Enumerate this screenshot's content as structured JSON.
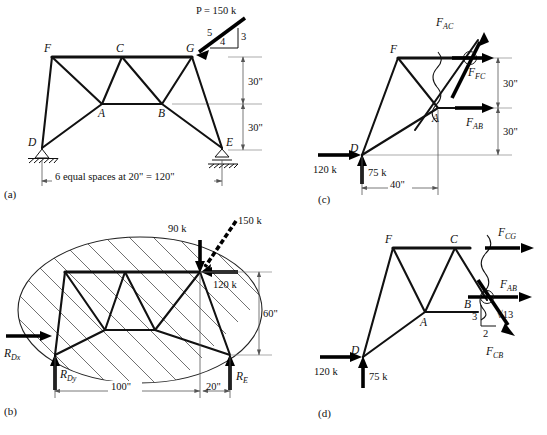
{
  "figure": {
    "panels": [
      {
        "id": "a",
        "label": "(a)"
      },
      {
        "id": "b",
        "label": "(b)"
      },
      {
        "id": "c",
        "label": "(c)"
      },
      {
        "id": "d",
        "label": "(d)"
      }
    ]
  },
  "panel_a": {
    "label": "(a)",
    "joints": [
      "F",
      "C",
      "G",
      "A",
      "B",
      "D",
      "E"
    ],
    "joint_F": "F",
    "joint_C": "C",
    "joint_G": "G",
    "joint_A": "A",
    "joint_B": "B",
    "joint_D": "D",
    "joint_E": "E",
    "applied_load": "P = 150 k",
    "slope_hyp": "5",
    "slope_vert": "3",
    "slope_horiz": "4",
    "dim_upper": "30\"",
    "dim_lower": "30\"",
    "span_note": "6 equal spaces at 20\" = 120\""
  },
  "panel_b": {
    "label": "(b)",
    "load_vertical": "90 k",
    "load_diagonal": "150 k",
    "load_horizontal": "120 k",
    "reaction_dx": "R",
    "reaction_dx_sub": "Dx",
    "reaction_dy": "R",
    "reaction_dy_sub": "Dy",
    "reaction_e": "R",
    "reaction_e_sub": "E",
    "dim_height": "60\"",
    "dim_main": "100\"",
    "dim_overhang": "20\""
  },
  "panel_c": {
    "label": "(c)",
    "joint_F": "F",
    "joint_A": "A",
    "joint_D": "D",
    "force_ac": "F",
    "force_ac_sub": "AC",
    "force_fc": "F",
    "force_fc_sub": "FC",
    "force_ab": "F",
    "force_ab_sub": "AB",
    "reaction_h": "120 k",
    "reaction_v": "75 k",
    "dim_upper": "30\"",
    "dim_lower": "30\"",
    "dim_horiz": "40\""
  },
  "panel_d": {
    "label": "(d)",
    "joint_F": "F",
    "joint_C": "C",
    "joint_A": "A",
    "joint_B": "B",
    "joint_D": "D",
    "force_cg": "F",
    "force_cg_sub": "CG",
    "force_ab": "F",
    "force_ab_sub": "AB",
    "force_cb": "F",
    "force_cb_sub": "CB",
    "slope_vert": "3",
    "slope_horiz": "2",
    "slope_hyp": "√13",
    "reaction_h": "120 k",
    "reaction_v": "75 k"
  },
  "colors": {
    "ink": "#111111",
    "dim": "#555555",
    "hatch": "#333333",
    "paper": "#ffffff"
  }
}
